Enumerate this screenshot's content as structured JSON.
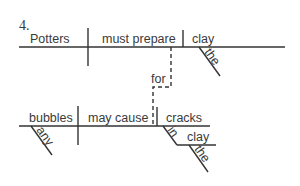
{
  "diagram": {
    "number": "4.",
    "main_clause": {
      "subject": "Potters",
      "verb": "must prepare",
      "object": "clay",
      "object_modifier": "the"
    },
    "connector": "for",
    "sub_clause": {
      "subject": "bubbles",
      "subject_modifier": "any",
      "verb": "may cause",
      "object": "cracks",
      "preposition": "in",
      "prep_object": "clay",
      "prep_object_modifier": "the"
    }
  }
}
